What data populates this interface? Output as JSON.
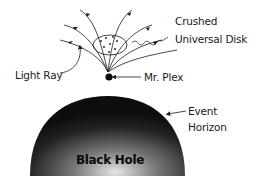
{
  "diagram": {
    "labels": {
      "crushed_disk_line1": "Crushed",
      "crushed_disk_line2": "Universal Disk",
      "light_ray": "Light Ray",
      "mr_plex": "Mr. Plex",
      "event_horizon_line1": "Event",
      "event_horizon_line2": "Horizon",
      "black_hole": "Black Hole"
    },
    "colors": {
      "ink": "#1a1a1a",
      "black_hole_edge": "#111111",
      "black_hole_center": "#d8d8d8",
      "background": "#ffffff"
    }
  }
}
